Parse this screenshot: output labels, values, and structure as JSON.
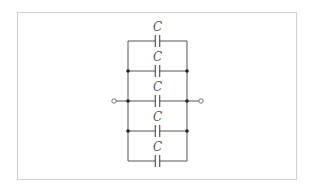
{
  "diagram": {
    "type": "circuit",
    "colors": {
      "wire": "#555555",
      "frame": "#cfcfcf",
      "background": "#ffffff"
    },
    "capacitors": [
      {
        "label": "C",
        "row_y": 41,
        "label_y": 32
      },
      {
        "label": "C",
        "row_y": 71,
        "label_y": 62
      },
      {
        "label": "C",
        "row_y": 101,
        "label_y": 92
      },
      {
        "label": "C",
        "row_y": 131,
        "label_y": 122
      },
      {
        "label": "C",
        "row_y": 161,
        "label_y": 152
      }
    ],
    "rails": {
      "left_x": 128,
      "right_x": 187,
      "top_y": 41,
      "bottom_y": 161
    },
    "terminals": {
      "left_x": 114,
      "right_x": 201,
      "y": 101
    },
    "junctions_y": [
      71,
      101,
      131
    ]
  }
}
